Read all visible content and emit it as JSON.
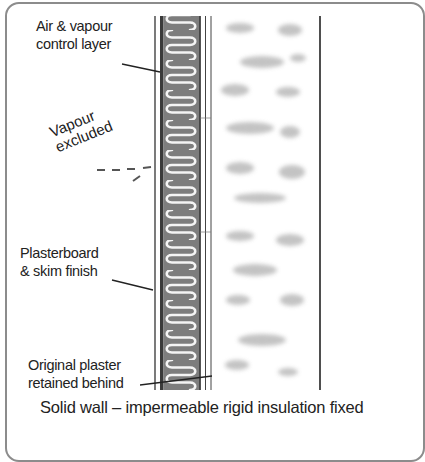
{
  "diagram": {
    "caption": "Solid wall – impermeable rigid insulation fixed",
    "labels": {
      "avcl_line1": "Air & vapour",
      "avcl_line2": "control layer",
      "vapour_line1": "Vapour",
      "vapour_line2": "excluded",
      "plasterboard_line1": "Plasterboard",
      "plasterboard_line2": "& skim finish",
      "original_line1": "Original plaster",
      "original_line2": "retained behind"
    },
    "layers": [
      {
        "name": "plasterboard & skim finish",
        "order": 1
      },
      {
        "name": "air & vapour control layer",
        "order": 2
      },
      {
        "name": "impermeable rigid insulation",
        "order": 3
      },
      {
        "name": "original plaster",
        "order": 4
      },
      {
        "name": "solid brick wall",
        "order": 5
      }
    ],
    "colors": {
      "frame": "#8c8c8c",
      "insulation": "#7a7a7a",
      "insulation_wave": "#ffffff",
      "line": "#2a2a2a",
      "brick_mottle": "#bdbdbd"
    }
  }
}
